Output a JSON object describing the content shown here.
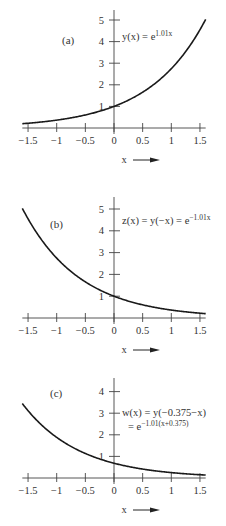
{
  "chart_data": [
    {
      "type": "line",
      "panel": "(a)",
      "title": "y(x) = e^{1.01x}",
      "equation_main": "y(x) = e",
      "equation_exponent": "1.01x",
      "xlabel": "x",
      "xlim": [
        -1.6,
        1.6
      ],
      "ylim": [
        0,
        5
      ],
      "xticks": [
        -1.5,
        -1,
        -0.5,
        0,
        0.5,
        1,
        1.5
      ],
      "xtick_labels": [
        "−1.5",
        "−1",
        "−0.5",
        "0",
        "0.5",
        "1",
        "1.5"
      ],
      "yticks": [
        1,
        2,
        3,
        4,
        5
      ],
      "ytick_labels": [
        "1",
        "2",
        "3",
        "4",
        "5"
      ],
      "function": {
        "a": 1.01,
        "shift": 0,
        "sign": 1
      },
      "x": [
        -1.6,
        -1.5,
        -1,
        -0.5,
        0,
        0.5,
        1,
        1.5,
        1.6
      ],
      "values": [
        0.2,
        0.22,
        0.36,
        0.6,
        1.0,
        1.66,
        2.75,
        4.55,
        5.03
      ]
    },
    {
      "type": "line",
      "panel": "(b)",
      "title": "z(x) = y(−x) = e^{−1.01x}",
      "equation_main": "z(x) = y(−x) = e",
      "equation_exponent": "−1.01x",
      "xlabel": "x",
      "xlim": [
        -1.6,
        1.6
      ],
      "ylim": [
        0,
        5
      ],
      "xticks": [
        -1.5,
        -1,
        -0.5,
        0,
        0.5,
        1,
        1.5
      ],
      "xtick_labels": [
        "−1.5",
        "−1",
        "−0.5",
        "0",
        "0.5",
        "1",
        "1.5"
      ],
      "yticks": [
        1,
        2,
        3,
        4,
        5
      ],
      "ytick_labels": [
        "1",
        "2",
        "3",
        "4",
        "5"
      ],
      "function": {
        "a": 1.01,
        "shift": 0,
        "sign": -1
      },
      "x": [
        -1.6,
        -1.5,
        -1,
        -0.5,
        0,
        0.5,
        1,
        1.5,
        1.6
      ],
      "values": [
        5.03,
        4.55,
        2.75,
        1.66,
        1.0,
        0.6,
        0.36,
        0.22,
        0.2
      ]
    },
    {
      "type": "line",
      "panel": "(c)",
      "title": "w(x) = y(−0.375−x) = e^{−1.01(x+0.375)}",
      "equation_main": "w(x) = y(−0.375−x)",
      "equation_line2": "= e",
      "equation_exponent": "−1.01(x+0.375)",
      "xlabel": "x",
      "xlim": [
        -1.6,
        1.6
      ],
      "ylim": [
        0,
        4
      ],
      "xticks": [
        -1.5,
        -1,
        -0.5,
        0,
        0.5,
        1,
        1.5
      ],
      "xtick_labels": [
        "−1.5",
        "−1",
        "−0.5",
        "0",
        "0.5",
        "1",
        "1.5"
      ],
      "yticks": [
        1,
        2,
        3,
        4
      ],
      "ytick_labels": [
        "1",
        "2",
        "3",
        "4"
      ],
      "function": {
        "a": 1.01,
        "shift": 0.375,
        "sign": -1
      },
      "x": [
        -1.6,
        -1.5,
        -1,
        -0.5,
        0,
        0.5,
        1,
        1.5,
        1.6
      ],
      "values": [
        3.46,
        3.13,
        1.89,
        1.14,
        0.68,
        0.41,
        0.25,
        0.15,
        0.14
      ]
    }
  ],
  "colors": {
    "curve": "#1a1a1a",
    "axis": "#444444",
    "text": "#333333"
  }
}
